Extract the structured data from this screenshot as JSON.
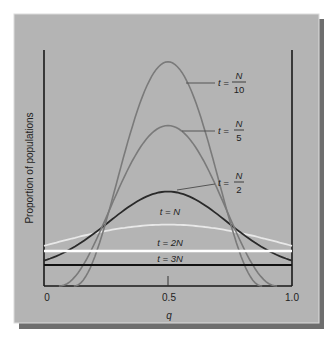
{
  "chart_data": {
    "type": "line",
    "title": "",
    "xlabel": "q",
    "ylabel": "Proportion of populations",
    "xlim": [
      0,
      1.0
    ],
    "x_ticks": [
      "0",
      "0.5",
      "1.0"
    ],
    "grid": false,
    "legend": "inline labels next to curves",
    "series": [
      {
        "name": "t = N/10",
        "label_t": "t =",
        "num": "N",
        "den": "10",
        "color": "#7a7a7a",
        "shape": "narrow bell",
        "peak_q": 0.5,
        "peak_rel": 0.95,
        "zero_at_q": [
          0.12,
          0.88
        ]
      },
      {
        "name": "t = N/5",
        "label_t": "t =",
        "num": "N",
        "den": "5",
        "color": "#7a7a7a",
        "shape": "bell",
        "peak_rel": 0.68,
        "zero_at_q": [
          0.06,
          0.94
        ]
      },
      {
        "name": "t = N/2",
        "label_t": "t =",
        "num": "N",
        "den": "2",
        "color": "#2a2a2a",
        "shape": "broad bell",
        "peak_rel": 0.4,
        "edge_rel": 0.07
      },
      {
        "name": "t = N",
        "label": "t = N",
        "color": "#e8e8e8",
        "shape": "flat arch",
        "peak_rel": 0.26,
        "edge_rel": 0.17
      },
      {
        "name": "t = 2N",
        "label": "t = 2N",
        "color": "#ffffff",
        "shape": "flat line",
        "value_rel": 0.145
      },
      {
        "name": "t = 3N",
        "label": "t = 3N",
        "color": "#111111",
        "shape": "flat line",
        "value_rel": 0.085
      }
    ]
  },
  "colors": {
    "panel": "#b4b4b4",
    "panel_edge": "#d8d8d8",
    "shadow": "#6e6e6e",
    "axis": "#1a1a1a"
  }
}
